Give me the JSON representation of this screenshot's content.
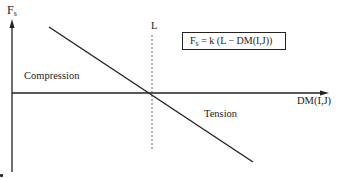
{
  "diagram": {
    "type": "force-displacement-plot",
    "y_axis": {
      "label_main": "F",
      "label_sub": "s"
    },
    "x_axis": {
      "label": "DM(I,J)"
    },
    "reference_line": {
      "label": "L",
      "style": "dashed"
    },
    "regions": {
      "upper_left": "Compression",
      "lower_right": "Tension"
    },
    "formula": {
      "lhs_main": "F",
      "lhs_sub": "s",
      "rhs": " = k (L − DM(I,J))"
    },
    "line": {
      "start": [
        49,
        27
      ],
      "end": [
        253,
        162
      ],
      "crosses_axis_at": [
        152,
        93
      ]
    },
    "colors": {
      "ink": "#222222",
      "background": "#ffffff"
    }
  }
}
